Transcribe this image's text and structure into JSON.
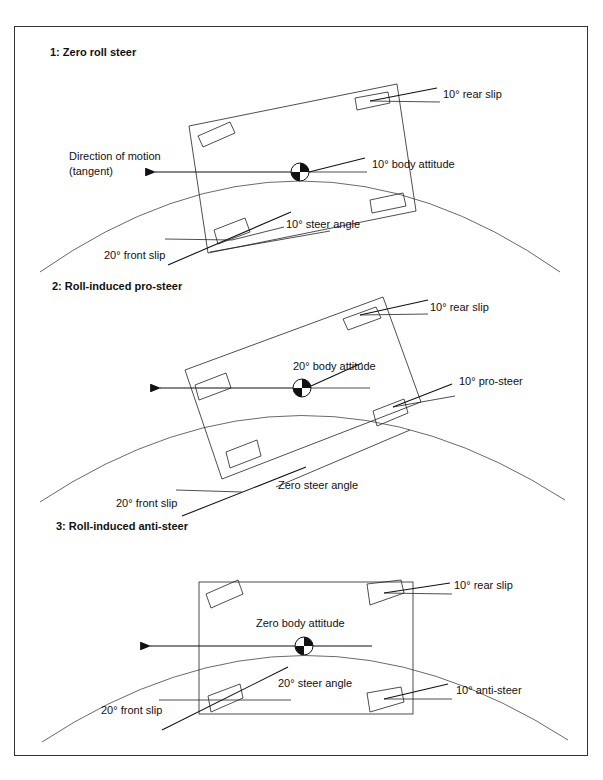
{
  "figure": {
    "panels": [
      {
        "title": "1:  Zero roll steer",
        "labels": {
          "rear_slip": "10° rear slip",
          "direction_line1": "Direction of motion",
          "direction_line2": "(tangent)",
          "body_attitude": "10° body attitude",
          "steer_angle": "10° steer angle",
          "front_slip": "20° front slip"
        }
      },
      {
        "title": "2:  Roll-induced pro-steer",
        "labels": {
          "rear_slip": "10° rear slip",
          "body_attitude": "20° body attitude",
          "rear_steer": "10° pro-steer",
          "steer_angle": "Zero steer angle",
          "front_slip": "20° front slip"
        }
      },
      {
        "title": "3:  Roll-induced anti-steer",
        "labels": {
          "rear_slip": "10° rear slip",
          "body_attitude": "Zero body attitude",
          "steer_angle": "20° steer angle",
          "rear_steer": "10° anti-steer",
          "front_slip": "20° front slip"
        }
      }
    ]
  }
}
